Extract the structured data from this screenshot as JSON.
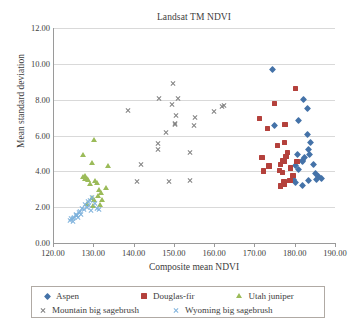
{
  "chart_data": {
    "type": "scatter",
    "title": "Landsat TM NDVI",
    "xlabel": "Composite mean NDVI",
    "ylabel": "Mean standard deviation",
    "xlim": [
      120,
      190
    ],
    "ylim": [
      0,
      12
    ],
    "xticks": [
      "120.00",
      "130.00",
      "140.00",
      "150.00",
      "160.00",
      "170.00",
      "180.00",
      "190.00"
    ],
    "yticks": [
      "0.00",
      "2.00",
      "4.00",
      "6.00",
      "8.00",
      "10.00",
      "12.00"
    ],
    "xtick_step": 10,
    "ytick_step": 2,
    "grid": "horizontal",
    "legend_position": "bottom",
    "series": [
      {
        "name": "Aspen",
        "marker": "diamond",
        "color": "#4472a8",
        "points": [
          [
            174.6,
            9.67
          ],
          [
            182.2,
            8.03
          ],
          [
            183.1,
            7.53
          ],
          [
            180.9,
            6.82
          ],
          [
            183.1,
            6.08
          ],
          [
            175.0,
            6.55
          ],
          [
            184.0,
            5.62
          ],
          [
            183.3,
            5.22
          ],
          [
            183.6,
            4.95
          ],
          [
            182.4,
            4.78
          ],
          [
            184.7,
            4.4
          ],
          [
            181.9,
            4.6
          ],
          [
            182.0,
            4.55
          ],
          [
            180.3,
            4.3
          ],
          [
            185.1,
            3.9
          ],
          [
            186.0,
            3.72
          ],
          [
            186.6,
            3.62
          ],
          [
            185.4,
            3.55
          ],
          [
            183.5,
            3.48
          ],
          [
            182.0,
            3.22
          ],
          [
            180.2,
            3.4
          ],
          [
            179.6,
            3.52
          ],
          [
            181.0,
            4.1
          ],
          [
            180.6,
            4.95
          ]
        ]
      },
      {
        "name": "Douglas-fir",
        "marker": "square",
        "color": "#b4413c",
        "points": [
          [
            180.2,
            8.62
          ],
          [
            175.0,
            7.78
          ],
          [
            171.3,
            6.96
          ],
          [
            177.6,
            6.6
          ],
          [
            173.3,
            6.4
          ],
          [
            177.4,
            5.62
          ],
          [
            175.7,
            5.45
          ],
          [
            171.9,
            4.78
          ],
          [
            178.2,
            5.05
          ],
          [
            177.8,
            4.82
          ],
          [
            176.9,
            4.62
          ],
          [
            177.5,
            4.58
          ],
          [
            180.6,
            4.55
          ],
          [
            176.4,
            4.38
          ],
          [
            178.9,
            4.18
          ],
          [
            173.6,
            4.3
          ],
          [
            172.2,
            4.02
          ],
          [
            176.2,
            4.05
          ],
          [
            177.0,
            3.95
          ],
          [
            179.6,
            3.78
          ],
          [
            177.3,
            3.42
          ],
          [
            177.5,
            3.28
          ],
          [
            178.8,
            3.48
          ],
          [
            176.4,
            3.18
          ]
        ]
      },
      {
        "name": "Utah juniper",
        "marker": "triangle",
        "color": "#9bbb59",
        "points": [
          [
            130.2,
            5.75
          ],
          [
            127.4,
            4.92
          ],
          [
            129.8,
            4.48
          ],
          [
            133.6,
            4.3
          ],
          [
            128.1,
            3.72
          ],
          [
            127.9,
            3.6
          ],
          [
            128.4,
            3.55
          ],
          [
            130.5,
            3.45
          ],
          [
            131.0,
            3.35
          ],
          [
            129.2,
            3.3
          ],
          [
            133.2,
            3.05
          ],
          [
            131.5,
            2.95
          ],
          [
            132.0,
            2.78
          ],
          [
            131.2,
            2.6
          ],
          [
            129.7,
            2.52
          ],
          [
            130.2,
            2.42
          ],
          [
            132.3,
            2.4
          ],
          [
            128.6,
            2.2
          ],
          [
            131.8,
            2.12
          ],
          [
            130.0,
            2.05
          ],
          [
            127.6,
            3.68
          ],
          [
            128.8,
            3.5
          ]
        ]
      },
      {
        "name": "Mountain big sagebrush",
        "marker": "cross",
        "color": "#808080",
        "points": [
          [
            149.8,
            8.88
          ],
          [
            146.4,
            8.05
          ],
          [
            151.0,
            8.05
          ],
          [
            162.4,
            7.7
          ],
          [
            162.0,
            7.62
          ],
          [
            149.5,
            7.72
          ],
          [
            138.6,
            7.38
          ],
          [
            150.6,
            7.12
          ],
          [
            160.0,
            7.32
          ],
          [
            155.2,
            7.0
          ],
          [
            150.3,
            6.68
          ],
          [
            150.2,
            6.6
          ],
          [
            155.0,
            6.55
          ],
          [
            148.0,
            6.2
          ],
          [
            146.1,
            5.58
          ],
          [
            146.0,
            5.2
          ],
          [
            154.0,
            5.05
          ],
          [
            141.9,
            4.38
          ],
          [
            154.1,
            3.5
          ],
          [
            140.8,
            3.44
          ],
          [
            148.9,
            3.42
          ]
        ]
      },
      {
        "name": "Wyoming big sagebrush",
        "marker": "cross",
        "color": "#7fb2dc",
        "points": [
          [
            129.6,
            2.52
          ],
          [
            129.2,
            2.4
          ],
          [
            128.8,
            2.3
          ],
          [
            130.4,
            2.22
          ],
          [
            129.0,
            2.1
          ],
          [
            128.4,
            2.0
          ],
          [
            130.8,
            1.92
          ],
          [
            131.3,
            1.85
          ],
          [
            127.2,
            1.95
          ],
          [
            127.6,
            1.88
          ],
          [
            126.8,
            1.78
          ],
          [
            126.4,
            1.7
          ],
          [
            127.0,
            1.62
          ],
          [
            126.0,
            1.55
          ],
          [
            125.6,
            1.52
          ],
          [
            125.2,
            1.45
          ],
          [
            124.9,
            1.4
          ],
          [
            124.5,
            1.35
          ],
          [
            124.2,
            1.28
          ],
          [
            125.0,
            1.22
          ],
          [
            126.2,
            1.42
          ],
          [
            128.0,
            2.18
          ],
          [
            129.4,
            1.8
          ],
          [
            125.8,
            1.62
          ]
        ]
      }
    ]
  },
  "legend": {
    "items": [
      {
        "label": "Aspen",
        "marker": "diamond-icon",
        "color": "#4472a8"
      },
      {
        "label": "Douglas-fir",
        "marker": "square-icon",
        "color": "#b4413c"
      },
      {
        "label": "Utah juniper",
        "marker": "triangle-icon",
        "color": "#9bbb59"
      },
      {
        "label": "Mountain big sagebrush",
        "marker": "cross-icon",
        "color": "#808080"
      },
      {
        "label": "Wyoming big sagebrush",
        "marker": "cross-icon",
        "color": "#7fb2dc"
      }
    ]
  }
}
